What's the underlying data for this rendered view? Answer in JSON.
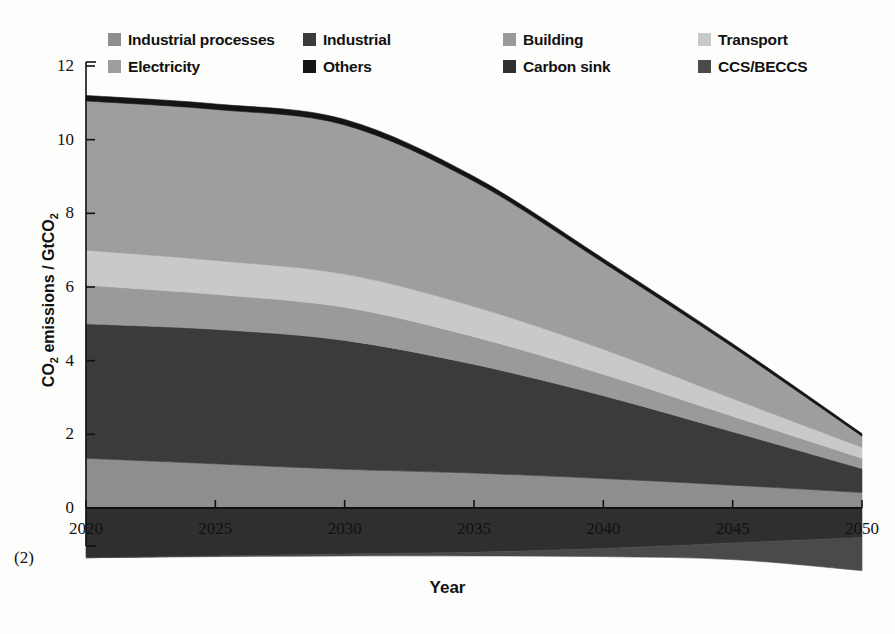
{
  "legend": {
    "rows": [
      [
        {
          "label": "Industrial processes",
          "color": "#8e8e8e",
          "key": "industrial_processes"
        },
        {
          "label": "Industrial",
          "color": "#3b3b3b",
          "key": "industrial"
        },
        {
          "label": "Building",
          "color": "#9a9a9a",
          "key": "building"
        },
        {
          "label": "Transport",
          "color": "#c9c9c9",
          "key": "transport"
        }
      ],
      [
        {
          "label": "Electricity",
          "color": "#9e9e9e",
          "key": "electricity"
        },
        {
          "label": "Others",
          "color": "#141414",
          "key": "others"
        },
        {
          "label": "Carbon sink",
          "color": "#2f2f2f",
          "key": "carbon_sink"
        },
        {
          "label": "CCS/BECCS",
          "color": "#4a4a4a",
          "key": "ccs_beccs"
        }
      ]
    ]
  },
  "axes": {
    "y_label": "CO2 emissions / GtCO2",
    "y_label_prefix": "CO",
    "y_label_sub1": "2",
    "y_label_mid": " emissions / GtCO",
    "y_label_sub2": "2",
    "x_label": "Year",
    "y_ticks": [
      0,
      2,
      4,
      6,
      8,
      10,
      12
    ],
    "x_ticks": [
      2020,
      2025,
      2030,
      2035,
      2040,
      2045,
      2050
    ],
    "ylim": [
      -1.6,
      12
    ],
    "xlim": [
      2020,
      2050
    ]
  },
  "footnote": "(2)",
  "chart_data": {
    "type": "area",
    "title": "",
    "xlabel": "Year",
    "ylabel": "CO2 emissions / GtCO2",
    "ylim": [
      -1.6,
      12
    ],
    "xlim": [
      2020,
      2050
    ],
    "grid": false,
    "legend_position": "top",
    "stacking": "stacked",
    "x": [
      2020,
      2025,
      2030,
      2035,
      2040,
      2045,
      2050
    ],
    "series": [
      {
        "name": "Carbon sink",
        "color": "#2f2f2f",
        "sign": "negative",
        "values": [
          -1.35,
          -1.3,
          -1.25,
          -1.2,
          -1.1,
          -0.95,
          -0.8
        ]
      },
      {
        "name": "CCS/BECCS",
        "color": "#4a4a4a",
        "sign": "negative",
        "values": [
          0.0,
          -0.02,
          -0.05,
          -0.1,
          -0.22,
          -0.45,
          -0.9
        ]
      },
      {
        "name": "Industrial processes",
        "color": "#8e8e8e",
        "sign": "positive",
        "values": [
          1.35,
          1.2,
          1.05,
          0.95,
          0.8,
          0.62,
          0.42
        ]
      },
      {
        "name": "Industrial",
        "color": "#3b3b3b",
        "sign": "positive",
        "values": [
          3.65,
          3.65,
          3.5,
          2.95,
          2.25,
          1.45,
          0.65
        ]
      },
      {
        "name": "Building",
        "color": "#9a9a9a",
        "sign": "positive",
        "values": [
          1.05,
          0.95,
          0.9,
          0.75,
          0.58,
          0.42,
          0.28
        ]
      },
      {
        "name": "Transport",
        "color": "#c9c9c9",
        "sign": "positive",
        "values": [
          0.95,
          0.92,
          0.9,
          0.82,
          0.68,
          0.48,
          0.3
        ]
      },
      {
        "name": "Electricity",
        "color": "#9e9e9e",
        "sign": "positive",
        "values": [
          4.05,
          4.1,
          4.05,
          3.4,
          2.35,
          1.4,
          0.3
        ]
      },
      {
        "name": "Others",
        "color": "#141414",
        "sign": "positive",
        "values": [
          0.15,
          0.15,
          0.15,
          0.13,
          0.11,
          0.09,
          0.07
        ]
      }
    ],
    "positive_totals": [
      11.2,
      11.05,
      10.45,
      9.0,
      6.75,
      4.46,
      2.02
    ],
    "negative_totals": [
      -1.35,
      -1.32,
      -1.3,
      -1.3,
      -1.32,
      -1.4,
      -1.7
    ]
  }
}
